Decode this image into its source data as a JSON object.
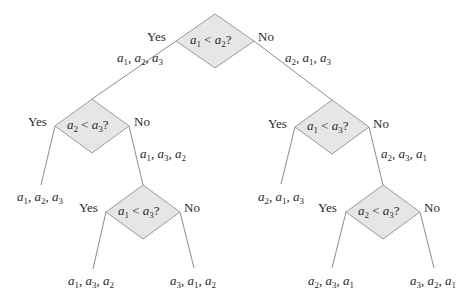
{
  "diagram": {
    "colors": {
      "diamond_fill": "#e6e6e6",
      "diamond_stroke": "#9a9a9a",
      "edge": "#8c8c8c",
      "text": "#2a2a2a"
    },
    "nodes": [
      {
        "id": "root",
        "question": "a1 < a2?",
        "cx": 215,
        "cy": 41,
        "hw": 39,
        "hh": 27
      },
      {
        "id": "L",
        "question": "a2 < a3?",
        "cx": 92,
        "cy": 126,
        "hw": 37,
        "hh": 27
      },
      {
        "id": "LR",
        "question": "a1 < a3?",
        "cx": 143,
        "cy": 212,
        "hw": 37,
        "hh": 27
      },
      {
        "id": "R",
        "question": "a1 < a3?",
        "cx": 332,
        "cy": 127,
        "hw": 37,
        "hh": 27
      },
      {
        "id": "RR",
        "question": "a2 < a3?",
        "cx": 383,
        "cy": 212,
        "hw": 37,
        "hh": 27
      }
    ],
    "edges": [
      {
        "from": "root",
        "to": "L",
        "x1": 176,
        "y1": 41,
        "x2": 92,
        "y2": 99
      },
      {
        "from": "root",
        "to": "R",
        "x1": 254,
        "y1": 41,
        "x2": 332,
        "y2": 100
      },
      {
        "from": "L",
        "to": "leaf1",
        "x1": 55,
        "y1": 126,
        "x2": 41,
        "y2": 185
      },
      {
        "from": "L",
        "to": "LR",
        "x1": 129,
        "y1": 126,
        "x2": 143,
        "y2": 185
      },
      {
        "from": "LR",
        "to": "leaf2",
        "x1": 106,
        "y1": 212,
        "x2": 93,
        "y2": 269
      },
      {
        "from": "LR",
        "to": "leaf3",
        "x1": 180,
        "y1": 212,
        "x2": 194,
        "y2": 268
      },
      {
        "from": "R",
        "to": "leaf4",
        "x1": 295,
        "y1": 127,
        "x2": 281,
        "y2": 184
      },
      {
        "from": "R",
        "to": "RR",
        "x1": 369,
        "y1": 127,
        "x2": 383,
        "y2": 185
      },
      {
        "from": "RR",
        "to": "leaf5",
        "x1": 346,
        "y1": 212,
        "x2": 332,
        "y2": 268
      },
      {
        "from": "RR",
        "to": "leaf6",
        "x1": 420,
        "y1": 212,
        "x2": 434,
        "y2": 268
      }
    ],
    "branch_labels": {
      "yes": "Yes",
      "no": "No"
    },
    "branch_label_positions": [
      {
        "text": "Yes",
        "x": 147,
        "y": 30
      },
      {
        "text": "No",
        "x": 258,
        "y": 30
      },
      {
        "text": "Yes",
        "x": 28,
        "y": 115
      },
      {
        "text": "No",
        "x": 134,
        "y": 115
      },
      {
        "text": "Yes",
        "x": 79,
        "y": 201
      },
      {
        "text": "No",
        "x": 184,
        "y": 201
      },
      {
        "text": "Yes",
        "x": 268,
        "y": 117
      },
      {
        "text": "No",
        "x": 373,
        "y": 117
      },
      {
        "text": "Yes",
        "x": 318,
        "y": 201
      },
      {
        "text": "No",
        "x": 424,
        "y": 201
      }
    ],
    "edge_perm_labels": [
      {
        "perm": [
          "1",
          "2",
          "3"
        ],
        "x": 117,
        "y": 51
      },
      {
        "perm": [
          "2",
          "1",
          "3"
        ],
        "x": 285,
        "y": 51
      },
      {
        "perm": [
          "1",
          "3",
          "2"
        ],
        "x": 140,
        "y": 147
      },
      {
        "perm": [
          "2",
          "3",
          "1"
        ],
        "x": 381,
        "y": 147
      }
    ],
    "leaves": [
      {
        "id": "leaf1",
        "perm": [
          "1",
          "2",
          "3"
        ],
        "x": 17,
        "y": 190
      },
      {
        "id": "leaf2",
        "perm": [
          "1",
          "3",
          "2"
        ],
        "x": 68,
        "y": 274
      },
      {
        "id": "leaf3",
        "perm": [
          "3",
          "1",
          "2"
        ],
        "x": 170,
        "y": 274
      },
      {
        "id": "leaf4",
        "perm": [
          "2",
          "1",
          "3"
        ],
        "x": 258,
        "y": 190
      },
      {
        "id": "leaf5",
        "perm": [
          "2",
          "3",
          "1"
        ],
        "x": 308,
        "y": 274
      },
      {
        "id": "leaf6",
        "perm": [
          "3",
          "2",
          "1"
        ],
        "x": 410,
        "y": 274
      }
    ]
  }
}
